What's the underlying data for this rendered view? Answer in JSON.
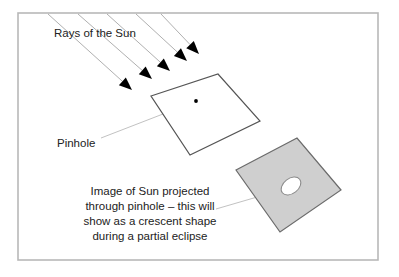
{
  "figure": {
    "kind": "pinhole-projection-diagram",
    "background_color": "#ffffff",
    "frame": {
      "name": "outer-border",
      "x": 18,
      "y": 13,
      "width": 360,
      "height": 247,
      "stroke": "#b8b8b8",
      "stroke_width": 1.6
    }
  },
  "labels": {
    "rays": "Rays of the Sun",
    "pinhole": "Pinhole",
    "caption_lines": [
      "Image of Sun projected",
      "through pinhole – this will",
      "show as a crescent shape",
      "during a partial eclipse"
    ]
  },
  "sun_rays": {
    "count": 5,
    "stroke": "#b0b0b0",
    "stroke_width": 1,
    "arrow_fill": "#000000",
    "lines": [
      {
        "x1": 48,
        "y1": 14,
        "x2": 132,
        "y2": 90
      },
      {
        "x1": 78,
        "y1": 14,
        "x2": 152,
        "y2": 79
      },
      {
        "x1": 107,
        "y1": 14,
        "x2": 170,
        "y2": 71
      },
      {
        "x1": 136,
        "y1": 14,
        "x2": 187,
        "y2": 61
      },
      {
        "x1": 161,
        "y1": 14,
        "x2": 199,
        "y2": 54
      }
    ]
  },
  "pinhole_card": {
    "name": "pinhole-card",
    "points": "151,96 218,74 260,121 190,155",
    "fill": "#ffffff",
    "stroke": "#555555",
    "stroke_width": 1.2,
    "pinhole_dot": {
      "cx": 196,
      "cy": 101,
      "r": 1.9,
      "fill": "#000000"
    }
  },
  "screen_card": {
    "name": "projection-screen",
    "points": "236,170 297,138 341,190 280,232",
    "fill": "#cfcfcf",
    "stroke": "#6b6b6b",
    "stroke_width": 1.2,
    "sun_image": {
      "name": "projected-sun-image",
      "cx": 291,
      "cy": 186,
      "rx": 11,
      "ry": 7.5,
      "rotation": -38,
      "fill": "#ffffff",
      "stroke": "#8a8a8a",
      "stroke_width": 1
    }
  },
  "leaders": {
    "stroke": "#c2c2c2",
    "stroke_width": 1,
    "pinhole_leader": {
      "x1": 101,
      "y1": 138,
      "x2": 194,
      "y2": 102
    },
    "caption_leader": {
      "x1": 216,
      "y1": 209,
      "x2": 288,
      "y2": 188
    }
  },
  "text_positions": {
    "rays": {
      "x": 54,
      "y": 37
    },
    "pinhole": {
      "x": 57,
      "y": 147
    },
    "caption_center_x": 150,
    "caption_first_y": 195,
    "caption_line_height": 15
  }
}
